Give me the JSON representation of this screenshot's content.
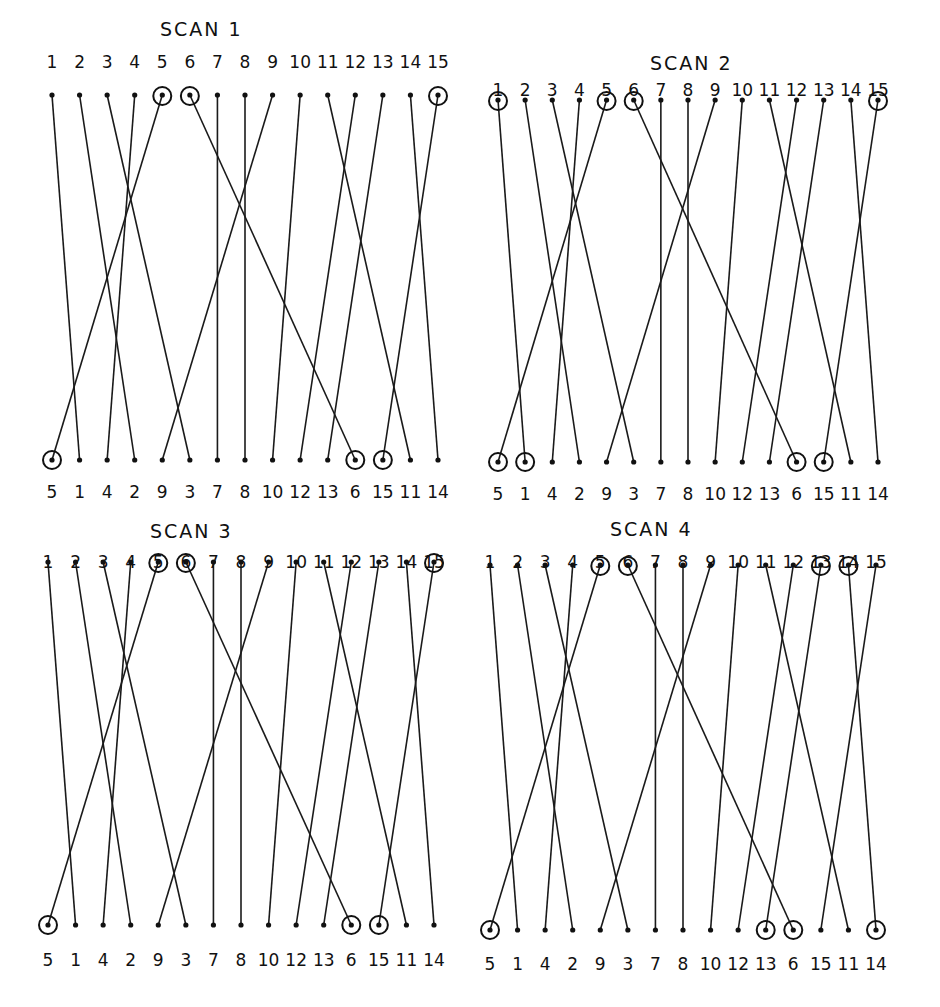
{
  "diagram": {
    "background": "#ffffff",
    "ink_color": "#111111",
    "top_order": [
      1,
      2,
      3,
      4,
      5,
      6,
      7,
      8,
      9,
      10,
      11,
      12,
      13,
      14,
      15
    ],
    "bottom_order": [
      5,
      1,
      4,
      2,
      9,
      3,
      7,
      8,
      10,
      12,
      13,
      6,
      15,
      11,
      14
    ],
    "panels": [
      {
        "title": "SCAN 1",
        "circled_top": [
          5,
          6,
          15
        ],
        "circled_bottom": [
          5,
          6,
          15
        ],
        "box": {
          "x0": 52,
          "x1": 438,
          "title_x": 160,
          "title_y": 18,
          "label_y": 50,
          "top_y": 95,
          "bottom_y": 460,
          "bottom_label_y": 494
        }
      },
      {
        "title": "SCAN 2",
        "circled_top": [
          1,
          5,
          6,
          15
        ],
        "circled_bottom": [
          5,
          1,
          6,
          15
        ],
        "box": {
          "x0": 498,
          "x1": 878,
          "title_x": 650,
          "title_y": 52,
          "label_y": 78,
          "top_y": 100,
          "bottom_y": 462,
          "bottom_label_y": 496
        }
      },
      {
        "title": "SCAN 3",
        "circled_top": [
          5,
          6,
          15
        ],
        "circled_bottom": [
          5,
          6,
          15
        ],
        "box": {
          "x0": 48,
          "x1": 434,
          "title_x": 150,
          "title_y": 520,
          "label_y": 550,
          "top_y": 562,
          "bottom_y": 925,
          "bottom_label_y": 962
        }
      },
      {
        "title": "SCAN 4",
        "circled_top": [
          5,
          6,
          13,
          14
        ],
        "circled_bottom": [
          5,
          13,
          6,
          14
        ],
        "box": {
          "x0": 490,
          "x1": 876,
          "title_x": 610,
          "title_y": 518,
          "label_y": 550,
          "top_y": 565,
          "bottom_y": 930,
          "bottom_label_y": 966
        }
      }
    ]
  }
}
